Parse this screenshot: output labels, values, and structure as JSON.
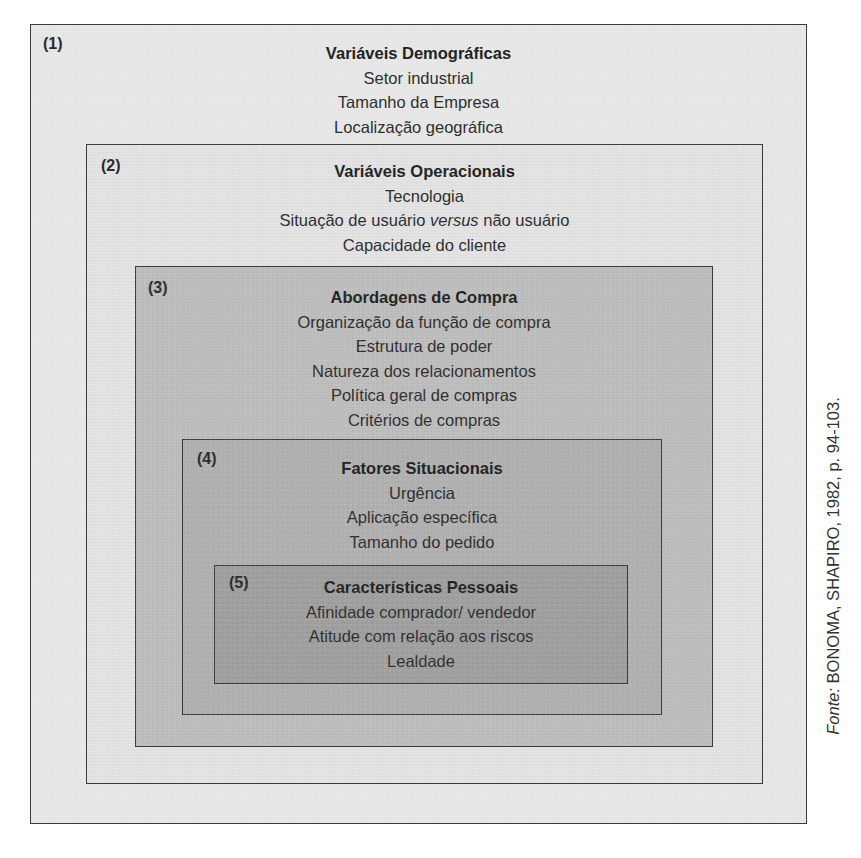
{
  "diagram": {
    "boxes": [
      {
        "number": "(1)",
        "title": "Variáveis Demográficas",
        "items": [
          "Setor industrial",
          "Tamanho da Empresa",
          "Localização geográfica"
        ],
        "fill": "#e7e7e7"
      },
      {
        "number": "(2)",
        "title": "Variáveis Operacionais",
        "items": [
          "Tecnologia",
          "Situação de usuário",
          "versus",
          "não usuário",
          "Capacidade do cliente"
        ],
        "fill": "#e3e3e3"
      },
      {
        "number": "(3)",
        "title": "Abordagens de Compra",
        "items": [
          "Organização da função de compra",
          "Estrutura de poder",
          "Natureza dos relacionamentos",
          "Política geral de compras",
          "Critérios de compras"
        ],
        "fill": "#bebebe"
      },
      {
        "number": "(4)",
        "title": "Fatores Situacionais",
        "items": [
          "Urgência",
          "Aplicação específica",
          "Tamanho do pedido"
        ],
        "fill": "#b1b1b1"
      },
      {
        "number": "(5)",
        "title": "Características Pessoais",
        "items": [
          "Afinidade comprador/ vendedor",
          "Atitude com relação aos riscos",
          "Lealdade"
        ],
        "fill": "#a0a0a0"
      }
    ],
    "source": {
      "label": "Fonte:",
      "text": " BONOMA, SHAPIRO, 1982, p. 94-103."
    }
  }
}
